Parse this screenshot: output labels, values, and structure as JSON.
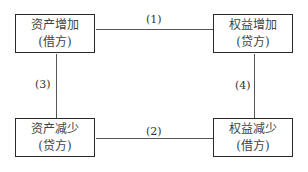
{
  "diagram": {
    "nodes": [
      {
        "id": "asset-increase",
        "line1": "资产增加",
        "line2": "(借方)"
      },
      {
        "id": "equity-increase",
        "line1": "权益增加",
        "line2": "(贷方)"
      },
      {
        "id": "asset-decrease",
        "line1": "资产减少",
        "line2": "(贷方)"
      },
      {
        "id": "equity-decrease",
        "line1": "权益减少",
        "line2": "(借方)"
      }
    ],
    "edges": [
      {
        "label": "(1)",
        "from": "asset-increase",
        "to": "equity-increase"
      },
      {
        "label": "(2)",
        "from": "asset-decrease",
        "to": "equity-decrease"
      },
      {
        "label": "(3)",
        "from": "asset-increase",
        "to": "asset-decrease"
      },
      {
        "label": "(4)",
        "from": "equity-increase",
        "to": "equity-decrease"
      }
    ]
  }
}
